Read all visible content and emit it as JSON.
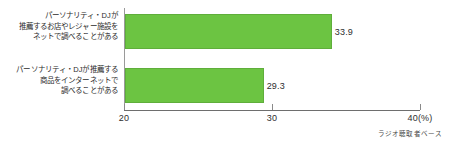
{
  "chart_data": {
    "type": "bar",
    "orientation": "horizontal",
    "title": "",
    "xlabel": "(%)",
    "ylabel": "",
    "xlim": [
      20,
      40
    ],
    "xticks": [
      {
        "value": 20,
        "label": "20"
      },
      {
        "value": 30,
        "label": "30"
      },
      {
        "value": 40,
        "label": "40(%)"
      }
    ],
    "grid": false,
    "legend": null,
    "bar_color": "#6cc442",
    "bar_border_color": "#5fae3b",
    "axis_color": "#6e6e6e",
    "categories": [
      "パーソナリティ・DJが推薦するお店やレジャー施設をネットで調べることがある",
      "パーソナリティ・DJが推薦する商品をインターネットで調べることがある"
    ],
    "values": [
      33.9,
      29.3
    ],
    "value_labels": [
      "33.9",
      "29.3"
    ],
    "series": [
      {
        "name": "",
        "values": [
          33.9,
          29.3
        ]
      }
    ],
    "bars": [
      {
        "label_lines": [
          "パーソナリティ・DJが",
          "推薦するお店やレジャー施設を",
          "ネットで調べることがある"
        ],
        "value": 33.9,
        "value_label": "33.9"
      },
      {
        "label_lines": [
          "パーソナリティ・DJが推薦する",
          "商品をインターネットで",
          "調べることがある"
        ],
        "value": 29.3,
        "value_label": "29.3"
      }
    ],
    "annotations": [
      {
        "name": "base-note",
        "text": "ラジオ聴取者ベース"
      }
    ]
  },
  "footnote": "ラジオ聴取者ベース"
}
